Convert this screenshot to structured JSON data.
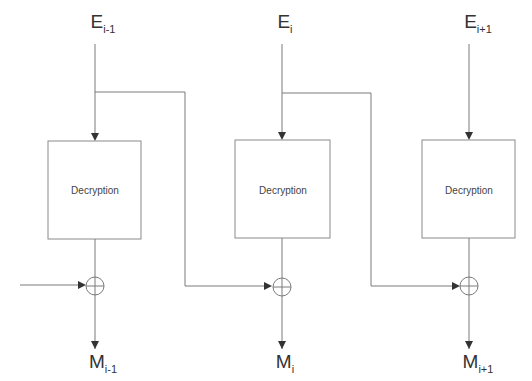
{
  "diagram": {
    "title": "",
    "type": "CBC decryption block diagram",
    "inputs": [
      {
        "base": "E",
        "sub": "i-1"
      },
      {
        "base": "E",
        "sub": "i"
      },
      {
        "base": "E",
        "sub": "i+1"
      }
    ],
    "blocks": [
      {
        "label": "Decryption"
      },
      {
        "label": "Decryption"
      },
      {
        "label": "Decryption"
      }
    ],
    "outputs": [
      {
        "base": "M",
        "sub": "i-1"
      },
      {
        "base": "M",
        "sub": "i"
      },
      {
        "base": "M",
        "sub": "i+1"
      }
    ],
    "operators": [
      "xor",
      "xor",
      "xor"
    ],
    "edges": [
      {
        "from": "E_i-1",
        "to": "Decryption_1"
      },
      {
        "from": "E_i",
        "to": "Decryption_2"
      },
      {
        "from": "E_i+1",
        "to": "Decryption_3"
      },
      {
        "from": "Decryption_1",
        "to": "XOR_1"
      },
      {
        "from": "Decryption_2",
        "to": "XOR_2"
      },
      {
        "from": "Decryption_3",
        "to": "XOR_3"
      },
      {
        "from": "(external input)",
        "to": "XOR_1"
      },
      {
        "from": "E_i-1",
        "to": "XOR_2"
      },
      {
        "from": "E_i",
        "to": "XOR_3"
      },
      {
        "from": "XOR_1",
        "to": "M_i-1"
      },
      {
        "from": "XOR_2",
        "to": "M_i"
      },
      {
        "from": "XOR_3",
        "to": "M_i+1"
      }
    ],
    "colors": {
      "line": "#7a7a7a",
      "text": "#333333",
      "background": "#ffffff"
    }
  }
}
